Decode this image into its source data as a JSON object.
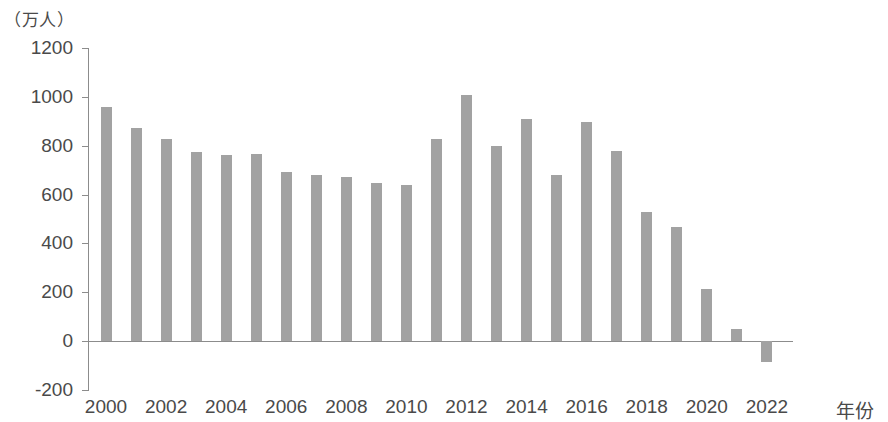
{
  "chart_data": {
    "type": "bar",
    "title": "",
    "subtitle": "",
    "xlabel": "年份",
    "ylabel": "（万人）",
    "y_unit_label": "（万人）",
    "grid": false,
    "legend": null,
    "ylim": [
      -200,
      1200
    ],
    "ytick_labels": [
      "1200",
      "1000",
      "800",
      "600",
      "400",
      "200",
      "0",
      "-200"
    ],
    "yticks": [
      1200,
      1000,
      800,
      600,
      400,
      200,
      0,
      -200
    ],
    "xtick_labels": [
      "2000",
      "2002",
      "2004",
      "2006",
      "2008",
      "2010",
      "2012",
      "2014",
      "2016",
      "2018",
      "2020",
      "2022"
    ],
    "xticks": [
      2000,
      2002,
      2004,
      2006,
      2008,
      2010,
      2012,
      2014,
      2016,
      2018,
      2020,
      2022
    ],
    "categories": [
      "2000",
      "2001",
      "2002",
      "2003",
      "2004",
      "2005",
      "2006",
      "2007",
      "2008",
      "2009",
      "2010",
      "2011",
      "2012",
      "2013",
      "2014",
      "2015",
      "2016",
      "2017",
      "2018",
      "2019",
      "2020",
      "2021",
      "2022"
    ],
    "values": [
      957,
      874,
      826,
      774,
      761,
      768,
      692,
      681,
      673,
      649,
      641,
      828,
      1006,
      800,
      910,
      680,
      896,
      779,
      530,
      467,
      215,
      48,
      -85
    ],
    "bar_color": "#a2a2a2",
    "axis_color": "#8c8c8c",
    "text_color": "#4a4a4a",
    "background_color": "#ffffff"
  }
}
